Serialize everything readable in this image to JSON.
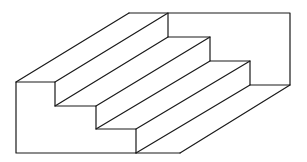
{
  "diagram": {
    "stroke_color": "#1a1a1a",
    "background_color": "#ffffff",
    "front_profile": [
      [
        16,
        82
      ],
      [
        55,
        82
      ],
      [
        55,
        106
      ],
      [
        96,
        106
      ],
      [
        96,
        129
      ],
      [
        136,
        129
      ],
      [
        136,
        153
      ],
      [
        16,
        153
      ],
      [
        16,
        82
      ]
    ],
    "back_profile": [
      [
        129,
        13
      ],
      [
        290,
        13
      ],
      [
        290,
        85
      ],
      [
        250,
        85
      ],
      [
        250,
        61
      ],
      [
        210,
        61
      ],
      [
        210,
        37
      ],
      [
        168,
        37
      ],
      [
        168,
        13
      ]
    ],
    "bottom_edge": [
      [
        136,
        153
      ],
      [
        180,
        153
      ]
    ],
    "depth_edges": [
      [
        [
          16,
          82
        ],
        [
          129,
          13
        ]
      ],
      [
        [
          55,
          82
        ],
        [
          168,
          13
        ]
      ],
      [
        [
          55,
          106
        ],
        [
          168,
          37
        ]
      ],
      [
        [
          96,
          106
        ],
        [
          210,
          37
        ]
      ],
      [
        [
          96,
          129
        ],
        [
          210,
          61
        ]
      ],
      [
        [
          136,
          129
        ],
        [
          250,
          61
        ]
      ],
      [
        [
          136,
          153
        ],
        [
          250,
          85
        ]
      ],
      [
        [
          180,
          153
        ],
        [
          290,
          85
        ]
      ]
    ]
  }
}
